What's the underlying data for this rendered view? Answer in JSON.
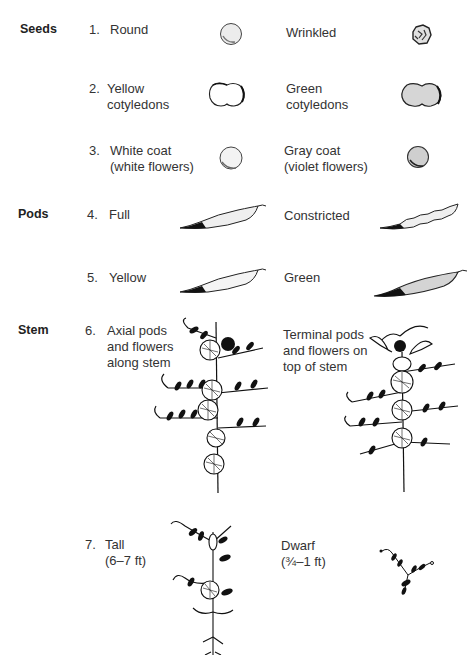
{
  "categories": [
    {
      "id": "seeds",
      "label": "Seeds"
    },
    {
      "id": "pods",
      "label": "Pods"
    },
    {
      "id": "stem",
      "label": "Stem"
    }
  ],
  "traits": [
    {
      "number": "1.",
      "dominant": "Round",
      "recessive": "Wrinkled",
      "dominant_icon": "round-seed-icon",
      "recessive_icon": "wrinkled-seed-icon"
    },
    {
      "number": "2.",
      "dominant": "Yellow\ncotyledons",
      "recessive": "Green\ncotyledons",
      "dominant_icon": "yellow-cotyledons-icon",
      "recessive_icon": "green-cotyledons-icon"
    },
    {
      "number": "3.",
      "dominant": "White coat\n(white flowers)",
      "recessive": "Gray coat\n(violet flowers)",
      "dominant_icon": "white-coat-seed-icon",
      "recessive_icon": "gray-coat-seed-icon"
    },
    {
      "number": "4.",
      "dominant": "Full",
      "recessive": "Constricted",
      "dominant_icon": "full-pod-icon",
      "recessive_icon": "constricted-pod-icon"
    },
    {
      "number": "5.",
      "dominant": "Yellow",
      "recessive": "Green",
      "dominant_icon": "yellow-pod-icon",
      "recessive_icon": "green-pod-icon"
    },
    {
      "number": "6.",
      "dominant": "Axial pods\nand flowers\nalong stem",
      "recessive": "Terminal pods\nand flowers on\ntop of stem",
      "dominant_icon": "axial-plant-icon",
      "recessive_icon": "terminal-plant-icon"
    },
    {
      "number": "7.",
      "dominant": "Tall\n(6–7 ft)",
      "recessive": "Dwarf\n(¾–1 ft)",
      "dominant_icon": "tall-plant-icon",
      "recessive_icon": "dwarf-plant-icon"
    }
  ],
  "colors": {
    "ink": "#1a1a1a",
    "seed_fill": "#d9d9d9",
    "gray_seed": "#c4c4c4",
    "pod_fill": "#e6e6e6"
  }
}
